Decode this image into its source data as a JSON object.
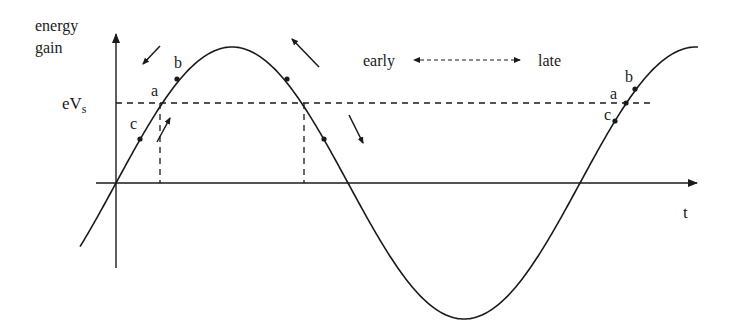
{
  "diagram": {
    "y_axis_label_line1": "energy",
    "y_axis_label_line2": "gain",
    "x_axis_label": "t",
    "synchronous_level_label": "eV",
    "synchronous_level_subscript": "s",
    "early_label": "early",
    "late_label": "late",
    "points_left": {
      "a": "a",
      "b": "b",
      "c": "c"
    },
    "points_right": {
      "a": "a",
      "b": "b",
      "c": "c"
    },
    "colors": {
      "stroke": "#1a1a1a",
      "background": "#ffffff"
    }
  },
  "chart_data": {
    "type": "line",
    "title": "",
    "xlabel": "t",
    "ylabel": "energy gain",
    "series": [
      {
        "name": "RF voltage (sinusoid)",
        "function": "A*sin(2*pi*t/T)",
        "amplitude": 1.0,
        "period_fraction_shown": 1.25
      }
    ],
    "reference_lines": [
      {
        "name": "eVs",
        "y": 0.59,
        "style": "dashed"
      }
    ],
    "annotations": [
      "a",
      "b",
      "c",
      "a",
      "b",
      "c",
      "early",
      "late"
    ]
  }
}
